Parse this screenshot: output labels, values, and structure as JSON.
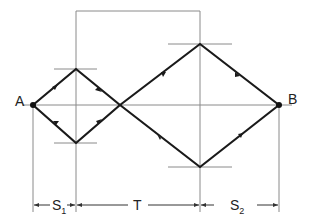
{
  "diagram": {
    "points": {
      "A": {
        "label": "A",
        "x": 33,
        "y": 105
      },
      "B": {
        "label": "B",
        "x": 279,
        "y": 105
      }
    },
    "dimensions": {
      "s1": {
        "label": "S",
        "subscript": "1"
      },
      "t": {
        "label": "T"
      },
      "s2": {
        "label": "S",
        "subscript": "2"
      }
    },
    "colors": {
      "thick_path": "#1a1a1a",
      "thin_line": "#8a8a8a",
      "text": "#222222",
      "background": "#ffffff"
    }
  }
}
